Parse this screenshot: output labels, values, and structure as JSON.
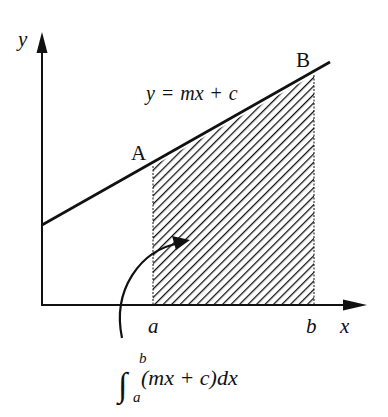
{
  "diagram": {
    "axes": {
      "x_label": "x",
      "y_label": "y"
    },
    "line": {
      "equation": "y = mx + c",
      "equation_parts": {
        "lhs": "y",
        "eq": "=",
        "m": "m",
        "x": "x",
        "plus": "+",
        "c": "c"
      }
    },
    "points": [
      {
        "name": "A",
        "label": "A"
      },
      {
        "name": "B",
        "label": "B"
      }
    ],
    "limits": {
      "lower": "a",
      "upper": "b"
    },
    "shaded_region": "hatched area between x = a and x = b under the line",
    "integral": {
      "upper_limit": "b",
      "lower_limit": "a",
      "integrand": "(mx + c)dx",
      "full_text": "∫_a^b (mx + c) dx"
    },
    "colors": {
      "ink": "#111111",
      "background": "#ffffff"
    }
  }
}
